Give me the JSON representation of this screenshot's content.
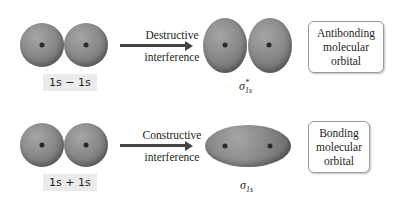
{
  "rows": [
    {
      "combination": "1s − 1s",
      "process_line1": "Destructive",
      "process_line2": "interference",
      "symbol": "σ",
      "symbol_sub": "1s",
      "symbol_sup": "*",
      "description_line1": "Antibonding",
      "description_line2": "molecular",
      "description_line3": "orbital"
    },
    {
      "combination": "1s + 1s",
      "process_line1": "Constructive",
      "process_line2": "interference",
      "symbol": "σ",
      "symbol_sub": "1s",
      "symbol_sup": "",
      "description_line1": "Bonding",
      "description_line2": "molecular",
      "description_line3": "orbital"
    }
  ]
}
